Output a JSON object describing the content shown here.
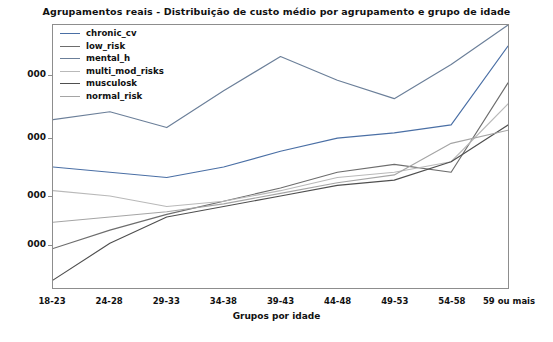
{
  "chart_data": {
    "type": "line",
    "title": "Agrupamentos reais - Distribuição de custo médio por agrupamento e grupo de idade",
    "xlabel": "Grupos por idade",
    "ylabel": "",
    "grid": false,
    "legend_position": "upper-left-inside",
    "categories": [
      "18-23",
      "24-28",
      "29-33",
      "34-38",
      "39-43",
      "44-48",
      "49-53",
      "54-58",
      "59 ou mais"
    ],
    "ytick_labels": [
      "000",
      "000",
      "000",
      "000"
    ],
    "ylim": [
      0,
      100
    ],
    "series": [
      {
        "name": "chronic_cv",
        "color": "#4a6fa5",
        "values": [
          46,
          44,
          42,
          46,
          52,
          57,
          59,
          62,
          92
        ]
      },
      {
        "name": "low_risk",
        "color": "#6d6d6d",
        "values": [
          15,
          22,
          28,
          33,
          38,
          44,
          47,
          44,
          78
        ]
      },
      {
        "name": "mental_h",
        "color": "#6b7f99",
        "values": [
          64,
          67,
          61,
          75,
          88,
          79,
          72,
          85,
          100
        ]
      },
      {
        "name": "multi_mod_risks",
        "color": "#b9b9b9",
        "values": [
          37,
          35,
          31,
          33,
          37,
          42,
          44,
          48,
          70
        ]
      },
      {
        "name": "musculosk",
        "color": "#4f4f4f",
        "values": [
          3,
          17,
          27,
          31,
          35,
          39,
          41,
          48,
          62
        ]
      },
      {
        "name": "normal_risk",
        "color": "#a5a5a5",
        "values": [
          25,
          27,
          29,
          32,
          36,
          40,
          43,
          55,
          60
        ]
      }
    ]
  },
  "axis": {
    "ytick_positions_px": [
      75,
      138,
      196,
      245
    ],
    "plot": {
      "left": 52,
      "top": 24,
      "width": 457,
      "height": 265
    }
  }
}
